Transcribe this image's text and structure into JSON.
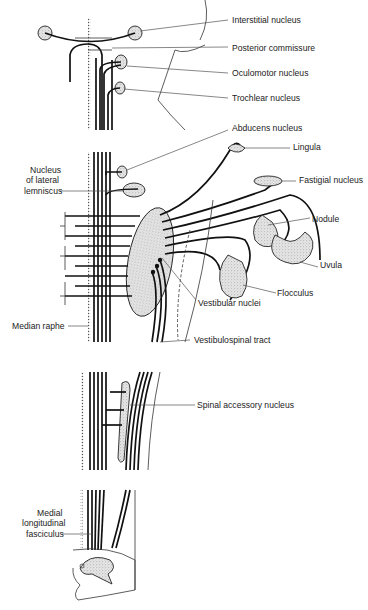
{
  "figure": {
    "labels": {
      "interstitial_nucleus": "Interstitial nucleus",
      "posterior_commissure": "Posterior commissure",
      "oculomotor_nucleus": "Oculomotor nucleus",
      "trochlear_nucleus": "Trochlear nucleus",
      "abducens_nucleus": "Abducens nucleus",
      "lingula": "Lingula",
      "fastigial_nucleus": "Fastigial nucleus",
      "nucleus_lateral_lemniscus_1": "Nucleus",
      "nucleus_lateral_lemniscus_2": "of lateral",
      "nucleus_lateral_lemniscus_3": "lemniscus",
      "nodule": "Nodule",
      "uvula": "Uvula",
      "flocculus": "Flocculus",
      "vestibular_nuclei": "Vestibular nuclei",
      "median_raphe": "Median raphe",
      "vestibulospinal_tract": "Vestibulospinal tract",
      "spinal_accessory_nucleus": "Spinal accessory nucleus",
      "mlf_1": "Medial",
      "mlf_2": "longitudinal",
      "mlf_3": "fasciculus"
    }
  }
}
